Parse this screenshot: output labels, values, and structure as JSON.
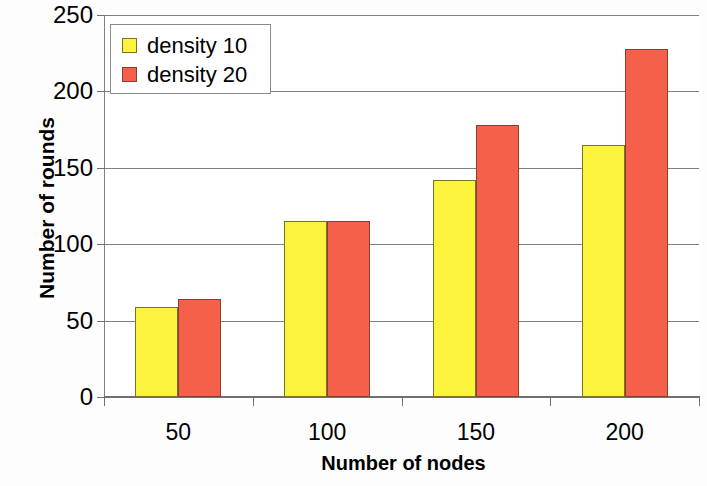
{
  "chart_data": {
    "type": "bar",
    "title": "",
    "xlabel": "Number of nodes",
    "ylabel": "Number of rounds",
    "categories": [
      "50",
      "100",
      "150",
      "200"
    ],
    "series": [
      {
        "name": "density 10",
        "color": "#fbf33c",
        "values": [
          59,
          115,
          142,
          165
        ]
      },
      {
        "name": "density 20",
        "color": "#f5604a",
        "values": [
          64,
          115,
          178,
          228
        ]
      }
    ],
    "ylim": [
      0,
      250
    ],
    "yticks": [
      "0",
      "50",
      "100",
      "150",
      "200",
      "250"
    ],
    "ytick_values": [
      0,
      50,
      100,
      150,
      200,
      250
    ],
    "grid": true,
    "legend_position": "top-left"
  }
}
